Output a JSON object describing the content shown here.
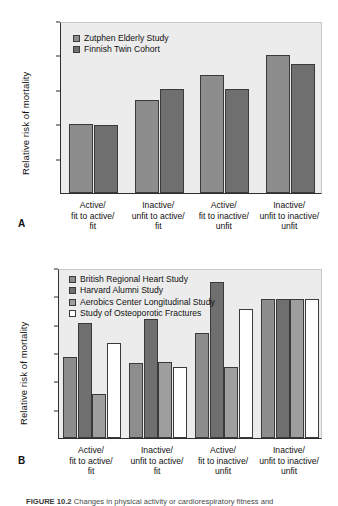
{
  "figure": {
    "caption_label": "FIGURE 10.2",
    "caption_text": "Changes in physical activity or cardiorespiratory fitness and"
  },
  "panel_a": {
    "label": "A",
    "ylabel": "Relative risk of mortality",
    "yticks": [
      "2.5",
      "2",
      "1.5",
      "1",
      "1.5",
      "0"
    ],
    "legend": [
      {
        "name": "Zutphen Elderly Study",
        "color": "#8d8d8d"
      },
      {
        "name": "Finnish Twin Cohort",
        "color": "#6f6f6f"
      }
    ],
    "categories": [
      [
        "Active/",
        "fit to active/",
        "fit"
      ],
      [
        "Inactive/",
        "unfit to active/",
        "fit"
      ],
      [
        "Active/",
        "fit to inactive/",
        "unfit"
      ],
      [
        "Inactive/",
        "unfit to inactive/",
        "unfit"
      ]
    ]
  },
  "panel_b": {
    "label": "B",
    "ylabel": "Relative risk of mortality",
    "yticks": [
      "1.2",
      "1",
      "0.8",
      "0.6",
      "0.4",
      "0.2",
      "0"
    ],
    "legend": [
      {
        "name": "British Regional Heart Study",
        "color": "#8d8d8d"
      },
      {
        "name": "Harvard Alumni Study",
        "color": "#6f6f6f"
      },
      {
        "name": "Aerobics Center Longitudinal Study",
        "color": "#9e9e9e"
      },
      {
        "name": "Study of Osteoporotic Fractures",
        "color": "#ffffff"
      }
    ],
    "categories": [
      [
        "Active/",
        "fit to active/",
        "fit"
      ],
      [
        "Inactive/",
        "unfit to active/",
        "fit"
      ],
      [
        "Active/",
        "fit to inactive/",
        "unfit"
      ],
      [
        "Inactive/",
        "unfit to inactive/",
        "unfit"
      ]
    ]
  },
  "chart_data": [
    {
      "type": "bar",
      "panel": "A",
      "title": "",
      "xlabel": "",
      "ylabel": "Relative risk of mortality",
      "ylim": [
        0,
        2.5
      ],
      "ytick_values": [
        2.5,
        2,
        1.5,
        1,
        0.5,
        0
      ],
      "ytick_labels": [
        "2.5",
        "2",
        "1.5",
        "1",
        "1.5",
        "0"
      ],
      "grid": false,
      "legend_position": "top-left",
      "categories": [
        "Active/ fit to active/ fit",
        "Inactive/ unfit to active/ fit",
        "Active/ fit to inactive/ unfit",
        "Inactive/ unfit to inactive/ unfit"
      ],
      "series": [
        {
          "name": "Zutphen Elderly Study",
          "color": "#8d8d8d",
          "values": [
            1.0,
            1.35,
            1.71,
            2.0
          ]
        },
        {
          "name": "Finnish Twin Cohort",
          "color": "#6f6f6f",
          "values": [
            0.99,
            1.51,
            1.51,
            1.88
          ]
        }
      ]
    },
    {
      "type": "bar",
      "panel": "B",
      "title": "",
      "xlabel": "",
      "ylabel": "Relative risk of mortality",
      "ylim": [
        0,
        1.2
      ],
      "ytick_values": [
        1.2,
        1,
        0.8,
        0.6,
        0.4,
        0.2,
        0
      ],
      "ytick_labels": [
        "1.2",
        "1",
        "0.8",
        "0.6",
        "0.4",
        "0.2",
        "0"
      ],
      "grid": false,
      "legend_position": "top-left",
      "categories": [
        "Active/ fit to active/ fit",
        "Inactive/ unfit to active/ fit",
        "Active/ fit to inactive/ unfit",
        "Inactive/ unfit to inactive/ unfit"
      ],
      "series": [
        {
          "name": "British Regional Heart Study",
          "color": "#8d8d8d",
          "values": [
            0.57,
            0.53,
            0.74,
            0.98
          ]
        },
        {
          "name": "Harvard Alumni Study",
          "color": "#6f6f6f",
          "values": [
            0.81,
            0.84,
            1.1,
            0.98
          ]
        },
        {
          "name": "Aerobics Center Longitudinal Study",
          "color": "#9e9e9e",
          "values": [
            0.31,
            0.54,
            0.5,
            0.98
          ]
        },
        {
          "name": "Study of Osteoporotic Fractures",
          "color": "#ffffff",
          "values": [
            0.67,
            0.5,
            0.91,
            0.98
          ]
        }
      ]
    }
  ]
}
